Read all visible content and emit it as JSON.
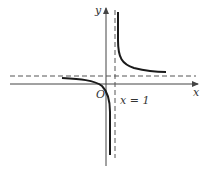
{
  "diagram": {
    "type": "function-graph",
    "axes": {
      "x_label": "x",
      "y_label": "y",
      "origin_label": "O"
    },
    "asymptotes": {
      "vertical_label": "x = 1"
    },
    "colors": {
      "curve": "#1a1a1a",
      "axis": "#444444",
      "asymptote": "#555555",
      "background": "#ffffff"
    }
  }
}
